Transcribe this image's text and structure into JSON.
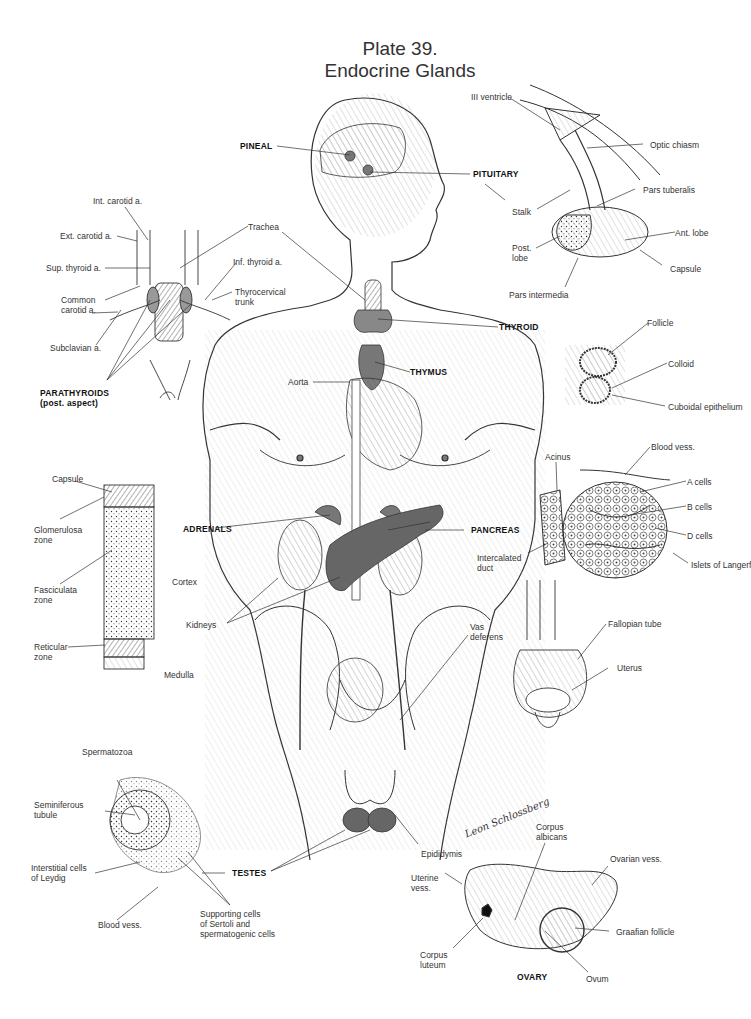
{
  "plate": {
    "number_label": "Plate 39.",
    "title": "Endocrine Glands"
  },
  "glands": {
    "pineal": "PINEAL",
    "pituitary": "PITUITARY",
    "thyroid": "THYROID",
    "thymus": "THYMUS",
    "parathyroids": "PARATHYROIDS\n(post. aspect)",
    "adrenals": "ADRENALS",
    "pancreas": "PANCREAS",
    "testes": "TESTES",
    "ovary": "OVARY"
  },
  "pituitary_detail": {
    "labels": [
      "III ventricle",
      "Optic chiasm",
      "Stalk",
      "Pars tuberalis",
      "Ant. lobe",
      "Post.\nlobe",
      "Capsule",
      "Pars intermedia"
    ]
  },
  "parathyroid_detail": {
    "labels": [
      "Int. carotid a.",
      "Ext. carotid a.",
      "Sup. thyroid a.",
      "Common\ncarotid a.",
      "Subclavian a.",
      "Trachea",
      "Inf. thyroid a.",
      "Thyrocervical\ntrunk"
    ]
  },
  "body_labels": {
    "aorta": "Aorta",
    "kidneys": "Kidneys",
    "vas_deferens": "Vas\ndeferens",
    "epididymis": "Epididymis"
  },
  "thyroid_detail": {
    "labels": [
      "Follicle",
      "Colloid",
      "Cuboidal epithelium"
    ]
  },
  "pancreas_detail": {
    "labels": [
      "Blood vess.",
      "Acinus",
      "A cells",
      "B cells",
      "D cells",
      "Intercalated\nduct",
      "Islets of Langerf"
    ]
  },
  "adrenal_detail": {
    "labels": [
      "Capsule",
      "Glomerulosa\nzone",
      "Fasciculata\nzone",
      "Cortex",
      "Reticular\nzone",
      "Medulla"
    ]
  },
  "uterus_detail": {
    "labels": [
      "Fallopian tube",
      "Uterus"
    ]
  },
  "testes_detail": {
    "labels": [
      "Spermatozoa",
      "Seminiferous\ntubule",
      "Interstitial cells\nof Leydig",
      "Blood vess.",
      "Supporting cells\nof Sertoli and\nspermatogenic cells"
    ]
  },
  "ovary_detail": {
    "labels": [
      "Corpus\nalbicans",
      "Ovarian vess.",
      "Uterine\nvess.",
      "Graafian follicle",
      "Corpus\nluteum",
      "Ovum"
    ]
  },
  "signature": "Leon Schlossberg",
  "colors": {
    "ink": "#2a2a2a",
    "background": "#ffffff",
    "gland_shading": "#555555"
  }
}
